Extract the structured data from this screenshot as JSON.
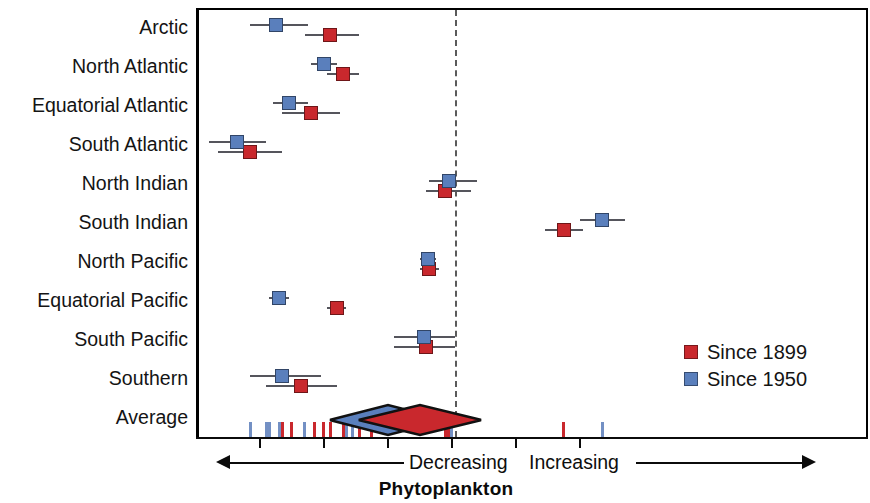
{
  "chart_data": {
    "type": "scatter",
    "subtype": "forest-plot",
    "title": "",
    "xlabel": "Phytoplankton",
    "ylabel": "",
    "categories": [
      "Arctic",
      "North Atlantic",
      "Equatorial Atlantic",
      "South Atlantic",
      "North Indian",
      "South Indian",
      "North Pacific",
      "Equatorial Pacific",
      "South Pacific",
      "Southern",
      "Average"
    ],
    "xlim": [
      -4.0,
      6.5
    ],
    "xticks": [
      -3.0,
      -2.0,
      -1.0,
      0.0,
      1.0,
      2.0
    ],
    "zero_reference": 0.0,
    "grid": false,
    "legend_position": "middle-right",
    "series": [
      {
        "name": "Since 1899",
        "color": "#c9282d",
        "marker": "square",
        "values": [
          -1.95,
          -1.75,
          -2.25,
          -3.2,
          -0.15,
          1.7,
          -0.4,
          -1.85,
          -0.45,
          -2.4,
          -0.55
        ],
        "ci_low": [
          -2.35,
          -2.0,
          -2.7,
          -3.7,
          -0.45,
          1.4,
          -0.55,
          -2.0,
          -0.95,
          -2.95,
          -1.05
        ],
        "ci_high": [
          -1.5,
          -1.5,
          -1.8,
          -2.7,
          0.25,
          2.0,
          -0.25,
          -1.7,
          0.0,
          -1.85,
          0.0
        ]
      },
      {
        "name": "Since 1950",
        "color": "#5a7fbc",
        "marker": "square",
        "values": [
          -2.8,
          -2.05,
          -2.6,
          -3.4,
          -0.1,
          2.3,
          -0.42,
          -2.75,
          -0.48,
          -2.7,
          -1.05
        ],
        "ci_low": [
          -3.2,
          -2.25,
          -2.85,
          -3.85,
          -0.4,
          1.95,
          -0.55,
          -2.9,
          -0.95,
          -3.2,
          -1.5
        ],
        "ci_high": [
          -2.3,
          -1.85,
          -2.3,
          -2.95,
          0.35,
          2.65,
          -0.3,
          -2.6,
          0.0,
          -2.1,
          -0.55
        ]
      }
    ],
    "average_row": {
      "label": "Average",
      "since_1899": {
        "center": -0.55,
        "low": -1.05,
        "high": 0.0,
        "shape": "diamond",
        "color": "#c9282d"
      },
      "since_1950": {
        "center": -1.05,
        "low": -1.5,
        "high": -0.55,
        "shape": "diamond",
        "color": "#5a7fbc"
      }
    },
    "rug": {
      "description": "individual trend tick marks along the x axis",
      "since_1899": [
        -2.7,
        -2.55,
        -2.2,
        -2.05,
        -1.95,
        -1.75,
        -1.5,
        -1.3,
        -0.15,
        -0.1,
        1.7
      ],
      "since_1950": [
        -3.2,
        -2.95,
        -2.9,
        -2.75,
        -2.7,
        -2.35,
        -2.05,
        -1.7,
        -1.6,
        -0.05,
        2.3
      ]
    },
    "annotations": [
      {
        "text": "Decreasing",
        "direction": "left"
      },
      {
        "text": "Increasing",
        "direction": "right"
      }
    ]
  },
  "axis": {
    "title": "Phytoplankton",
    "decreasing_label": "Decreasing",
    "increasing_label": "Increasing"
  },
  "legend": {
    "items": [
      {
        "label": "Since 1899",
        "color": "#c9282d"
      },
      {
        "label": "Since 1950",
        "color": "#5a7fbc"
      }
    ]
  },
  "labels": {
    "arctic": "Arctic",
    "north_atlantic": "North Atlantic",
    "equatorial_atlantic": "Equatorial Atlantic",
    "south_atlantic": "South Atlantic",
    "north_indian": "North Indian",
    "south_indian": "South Indian",
    "north_pacific": "North Pacific",
    "equatorial_pacific": "Equatorial Pacific",
    "south_pacific": "South Pacific",
    "southern": "Southern",
    "average": "Average"
  },
  "colors": {
    "since_1899": "#c9282d",
    "since_1950": "#5a7fbc",
    "axis": "#0b0b0b",
    "errorbar": "#55555c",
    "zero_line": "#5a5a5a"
  }
}
